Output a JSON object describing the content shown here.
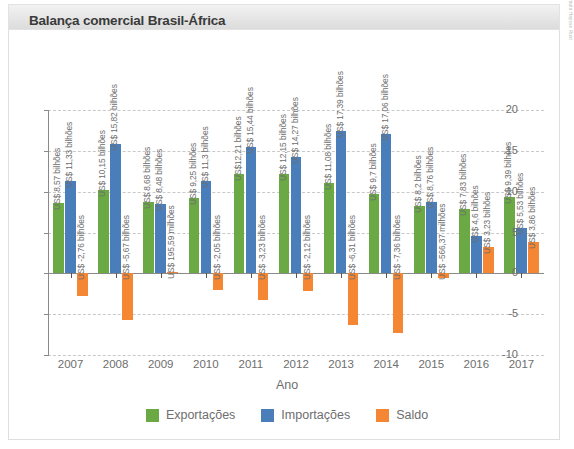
{
  "header": {
    "title": "Balança comercial Brasil-África"
  },
  "credit": "Paula Haysse Rust",
  "legend": {
    "items": [
      {
        "label": "Exportações",
        "color": "#6aa944"
      },
      {
        "label": "Importações",
        "color": "#4a7ebb"
      },
      {
        "label": "Saldo",
        "color": "#f58634"
      }
    ]
  },
  "chart_data": {
    "type": "bar",
    "title": "Balança comercial Brasil-África",
    "xlabel": "Ano",
    "ylabel": "",
    "ylim": [
      -10,
      20
    ],
    "yticks": [
      "20",
      "15",
      "10",
      "5",
      "0",
      "-5",
      "-10"
    ],
    "ytick_values": [
      20,
      15,
      10,
      5,
      0,
      -5,
      -10
    ],
    "grid": true,
    "legend_position": "bottom",
    "categories": [
      "2007",
      "2008",
      "2009",
      "2010",
      "2011",
      "2012",
      "2013",
      "2014",
      "2015",
      "2016",
      "2017"
    ],
    "series": [
      {
        "name": "Exportações",
        "color": "#6aa944",
        "values": [
          8.57,
          10.15,
          8.68,
          9.25,
          12.21,
          12.15,
          11.08,
          9.7,
          8.2,
          7.83,
          9.39
        ],
        "labels": [
          "US$ 8,57 bilhões",
          "US$ 10,15 bilhões",
          "US$ 8,68 bilhões",
          "US$ 9,25 bilhões",
          "US$12,21 bilhões",
          "US$ 12,15 bilhões",
          "US$ 11,08 bilhões",
          "US$ 9,7 bilhões",
          "US$ 8,2 bilhões",
          "US$ 7,83 bilhões",
          "US$ 9,39 bilhões"
        ]
      },
      {
        "name": "Importações",
        "color": "#4a7ebb",
        "values": [
          11.33,
          15.82,
          8.48,
          11.3,
          15.44,
          14.27,
          17.39,
          17.06,
          8.76,
          4.6,
          5.53
        ],
        "labels": [
          "US$ 11,33 bilhões",
          "US$ 15,82 bilhões",
          "US$ 8,48 bilhões",
          "US$ 11,3 bilhões",
          "US$ 15,44 bilhões",
          "US$ 14,27 bilhões",
          "US$ 17,39 bilhões",
          "US$ 17,06 bilhões",
          "US$ 8,76 bilhões",
          "US$ 4,6 bilhões",
          "US$ 5,53 bilhões"
        ]
      },
      {
        "name": "Saldo",
        "color": "#f58634",
        "values": [
          -2.76,
          -5.67,
          0.19559,
          -2.05,
          -3.23,
          -2.12,
          -6.31,
          -7.36,
          -0.56637,
          3.23,
          3.86
        ],
        "labels": [
          "US$ -2,76 bilhões",
          "US$ -5,67 bilhões",
          "US$ 195,59 milhões",
          "US$ -2,05 bilhões",
          "US$ -3,23 bilhões",
          "US$ -2,12 bilhões",
          "US$ -6,31 bilhões",
          "US$ -7,36 bilhões",
          "US$ -566,37 milhões",
          "US$ 3,23 bilhões",
          "US$ 3,86 bilhões"
        ]
      }
    ]
  }
}
